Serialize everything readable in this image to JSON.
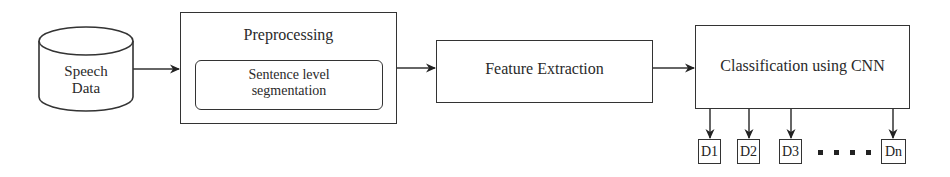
{
  "diagram": {
    "type": "flowchart",
    "direction": "left-to-right",
    "nodes": [
      {
        "id": "speech_data",
        "shape": "cylinder",
        "label_lines": [
          "Speech",
          "Data"
        ]
      },
      {
        "id": "preprocessing",
        "shape": "rectangle",
        "label": "Preprocessing",
        "children": [
          {
            "id": "segmentation",
            "shape": "rounded-rectangle",
            "label_lines": [
              "Sentence level",
              "segmentation"
            ]
          }
        ]
      },
      {
        "id": "feature_extraction",
        "shape": "rectangle",
        "label": "Feature Extraction"
      },
      {
        "id": "classification",
        "shape": "rectangle",
        "label": "Classification using CNN"
      }
    ],
    "outputs": [
      "D1",
      "D2",
      "D3",
      "Dn"
    ],
    "ellipsis": "....",
    "edges": [
      {
        "from": "speech_data",
        "to": "preprocessing"
      },
      {
        "from": "preprocessing",
        "to": "feature_extraction"
      },
      {
        "from": "feature_extraction",
        "to": "classification"
      },
      {
        "from": "classification",
        "to": "D1"
      },
      {
        "from": "classification",
        "to": "D2"
      },
      {
        "from": "classification",
        "to": "D3"
      },
      {
        "from": "classification",
        "to": "Dn"
      }
    ]
  }
}
